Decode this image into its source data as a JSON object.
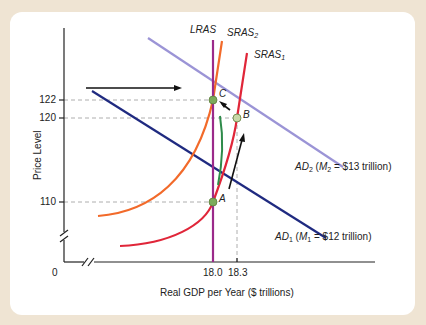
{
  "diagram": {
    "type": "AD-AS macroeconomic diagram",
    "axes": {
      "y_label": "Price Level",
      "x_label": "Real GDP per Year ($ trillions)",
      "origin_label": "0",
      "y_ticks": [
        "122",
        "120",
        "110"
      ],
      "x_ticks": [
        "18.0",
        "18.3"
      ]
    },
    "curves": {
      "lras": {
        "name": "LRAS",
        "color": "#9b2a8a"
      },
      "sras2": {
        "name": "SRAS",
        "sub": "2",
        "color": "#f26a2a"
      },
      "sras1": {
        "name": "SRAS",
        "sub": "1",
        "color": "#e02639"
      },
      "ad2": {
        "name": "AD",
        "sub": "2",
        "detail_pre": " (",
        "m": "M",
        "m_sub": "2",
        "detail_post": " = $13 trillion)",
        "color": "#9b94d6"
      },
      "ad1": {
        "name": "AD",
        "sub": "1",
        "detail_pre": " (",
        "m": "M",
        "m_sub": "1",
        "detail_post": " = $12 trillion)",
        "color": "#1f2a80"
      },
      "adjustment_path": {
        "color": "#2e8b4a"
      }
    },
    "points": [
      {
        "label": "A",
        "gdp": "18.0",
        "price": "110"
      },
      {
        "label": "B",
        "gdp": "18.3",
        "price": "120"
      },
      {
        "label": "C",
        "gdp": "18.0",
        "price": "122"
      }
    ],
    "colors": {
      "background": "#efe4d3",
      "card": "#ffffff",
      "axis": "#222222",
      "guide": "#999999",
      "point": "#6aa84f"
    }
  }
}
